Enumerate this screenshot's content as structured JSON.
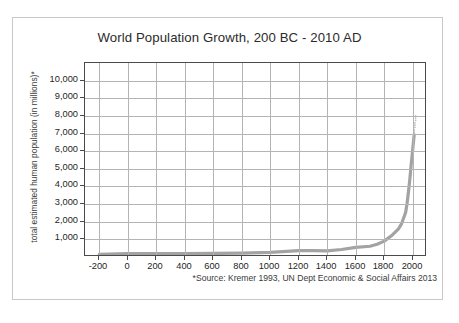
{
  "chart_data": {
    "type": "line",
    "title": "World Population Growth, 200 BC - 2010 AD",
    "xlabel": "",
    "ylabel": "total estimated human population (in millions)*",
    "source_note": "*Source: Kremer 1993, UN Dept Economic & Social Affairs 2013",
    "xlim": [
      -300,
      2100
    ],
    "ylim": [
      0,
      11000
    ],
    "grid": true,
    "legend": "none",
    "line_color": "#a3a3a3",
    "axis_color": "#4a4a4a",
    "grid_color": "#b4b4b4",
    "x_ticks": [
      -200,
      0,
      200,
      400,
      600,
      800,
      1000,
      1200,
      1400,
      1600,
      1800,
      2000
    ],
    "x_tick_labels": [
      "-200",
      "0",
      "200",
      "400",
      "600",
      "800",
      "1000",
      "1200",
      "1400",
      "1600",
      "1800",
      "2000"
    ],
    "y_ticks": [
      1000,
      2000,
      3000,
      4000,
      5000,
      6000,
      7000,
      8000,
      9000,
      10000
    ],
    "y_tick_labels": [
      "1,000",
      "2,000",
      "3,000",
      "4,000",
      "5,000",
      "6,000",
      "7,000",
      "8,000",
      "9,000",
      "10,000"
    ],
    "series": [
      {
        "name": "world population",
        "x": [
          -200,
          0,
          200,
          400,
          600,
          800,
          1000,
          1200,
          1300,
          1400,
          1500,
          1600,
          1700,
          1750,
          1800,
          1850,
          1900,
          1920,
          1940,
          1950,
          1960,
          1970,
          1980,
          1990,
          2000,
          2010
        ],
        "values": [
          150,
          190,
          190,
          190,
          200,
          220,
          265,
          360,
          360,
          350,
          425,
          545,
          610,
          720,
          900,
          1200,
          1600,
          1860,
          2300,
          2530,
          3030,
          3700,
          4440,
          5320,
          6120,
          6930
        ]
      },
      {
        "name": "projection-dots",
        "x": [
          2010,
          2015,
          2020
        ],
        "values": [
          7200,
          7600,
          8000
        ]
      }
    ]
  }
}
